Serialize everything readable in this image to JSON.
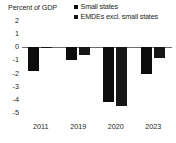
{
  "chart_data": {
    "type": "bar",
    "title": "Percent of GDP",
    "xlabel": "",
    "ylabel": "",
    "categories": [
      "2011",
      "2019",
      "2020",
      "2023"
    ],
    "series": [
      {
        "name": "Small states",
        "color": "#0d0d0d",
        "values": [
          -1.8,
          -1.0,
          -4.2,
          -2.0
        ]
      },
      {
        "name": "EMDEs excl. small states",
        "color": "#171717",
        "values": [
          -0.05,
          -0.6,
          -4.5,
          -0.8
        ]
      }
    ],
    "ylim": [
      -5,
      2
    ],
    "yticks": [
      2,
      1,
      0,
      -1,
      -2,
      -3,
      -4,
      -5
    ],
    "ytick_labels": [
      "2",
      "1",
      "0",
      "-1",
      "-2",
      "-3",
      "-4",
      "-5"
    ],
    "grid": false,
    "legend_position": "top-right",
    "zero_line_color": "#6d6e71"
  },
  "legend": {
    "items": [
      {
        "label": "Small states"
      },
      {
        "label": "EMDEs excl. small states"
      }
    ]
  }
}
